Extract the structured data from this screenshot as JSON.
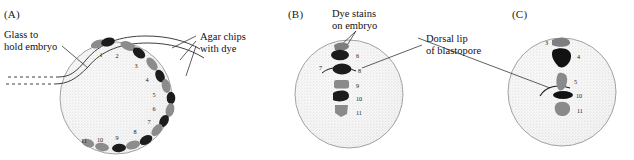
{
  "figure": {
    "background_color": "#ffffff",
    "ink_color": "#1a1a1a",
    "stipple_color": "#c9c9c9",
    "chip_dark_color": "#1c1c1c",
    "chip_gray_color": "#8c8c8c"
  },
  "panels": [
    {
      "id": "A",
      "label": "(A)",
      "callouts": [
        {
          "name": "glass-holder",
          "text_line_1": "Glass to",
          "text_line_2": "hold embryo"
        },
        {
          "name": "agar-chips",
          "text_line_1": "Agar chips",
          "text_line_2": "with dye"
        }
      ],
      "embryo_label": "Embryo",
      "chip_numbers": [
        "1",
        "2",
        "3",
        "4",
        "5",
        "6",
        "7",
        "8",
        "9",
        "10",
        "11"
      ]
    },
    {
      "id": "B",
      "label": "(B)",
      "callouts": [
        {
          "name": "dye-stains",
          "text_line_1": "Dye stains",
          "text_line_2": "on embryo"
        },
        {
          "name": "dorsal-lip",
          "text_line_1": "Dorsal lip",
          "text_line_2": "of blastopore"
        }
      ],
      "stain_numbers": [
        "6",
        "7",
        "8",
        "9",
        "10",
        "11"
      ]
    },
    {
      "id": "C",
      "label": "(C)",
      "callouts": [],
      "stain_numbers": [
        "3",
        "4",
        "5",
        "10",
        "11"
      ]
    }
  ],
  "labels": {
    "panel_a": "(A)",
    "panel_b": "(B)",
    "panel_c": "(C)",
    "glass_l1": "Glass to",
    "glass_l2": "hold embryo",
    "agar_l1": "Agar chips",
    "agar_l2": "with dye",
    "dye_l1": "Dye stains",
    "dye_l2": "on embryo",
    "dorsal_l1": "Dorsal lip",
    "dorsal_l2": "of blastopore",
    "embryo": "Embryo"
  },
  "numbers": {
    "a1": "1",
    "a2": "2",
    "a3": "3",
    "a4": "4",
    "a5": "5",
    "a6": "6",
    "a7": "7",
    "a8": "8",
    "a9": "9",
    "a10": "10",
    "a11": "11",
    "b6": "6",
    "b7": "7",
    "b8": "8",
    "b9": "9",
    "b10": "10",
    "b11": "11",
    "c3": "3",
    "c4": "4",
    "c5": "5",
    "c10": "10",
    "c11": "11"
  }
}
